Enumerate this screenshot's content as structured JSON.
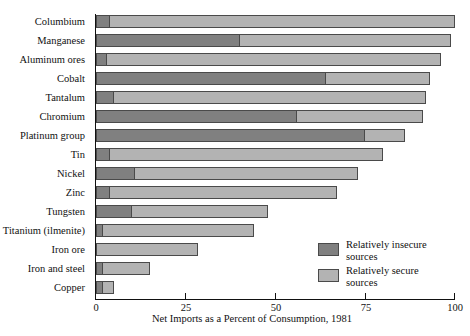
{
  "chart_data": {
    "type": "bar",
    "orientation": "horizontal",
    "stacked": true,
    "title": "",
    "xlabel": "Net Imports as a Percent of Consumption, 1981",
    "ylabel": "",
    "xlim": [
      0,
      100
    ],
    "xticks": [
      0,
      25,
      50,
      75,
      100
    ],
    "xticklabels": [
      "0",
      "25",
      "50",
      "75",
      "100"
    ],
    "grid": false,
    "legend_position": "inside-lower-right",
    "categories": [
      "Columbium",
      "Manganese",
      "Aluminum ores",
      "Cobalt",
      "Tantalum",
      "Chromium",
      "Platinum group",
      "Tin",
      "Nickel",
      "Zinc",
      "Tungsten",
      "Titanium (ilmenite)",
      "Iron ore",
      "Iron and steel",
      "Copper"
    ],
    "series": [
      {
        "name": "Relatively insecure sources",
        "color": "#808080",
        "values": [
          4,
          40,
          3,
          64,
          5,
          56,
          75,
          4,
          11,
          4,
          10,
          2,
          0,
          2,
          2
        ]
      },
      {
        "name": "Relatively secure sources",
        "color": "#b3b3b3",
        "values": [
          96,
          59,
          93,
          29,
          87,
          35,
          11,
          76,
          62,
          63,
          38,
          42,
          28,
          13,
          3
        ]
      }
    ],
    "totals": [
      100,
      99,
      96,
      93,
      92,
      91,
      86,
      80,
      73,
      67,
      48,
      44,
      28,
      15,
      5
    ]
  },
  "legend": {
    "entries": [
      {
        "label_line1": "Relatively insecure",
        "label_line2": "sources",
        "swatch": "#808080"
      },
      {
        "label_line1": "Relatively secure",
        "label_line2": "sources",
        "swatch": "#b3b3b3"
      }
    ]
  },
  "axis": {
    "x_title": "Net Imports as a Percent of Consumption, 1981"
  }
}
